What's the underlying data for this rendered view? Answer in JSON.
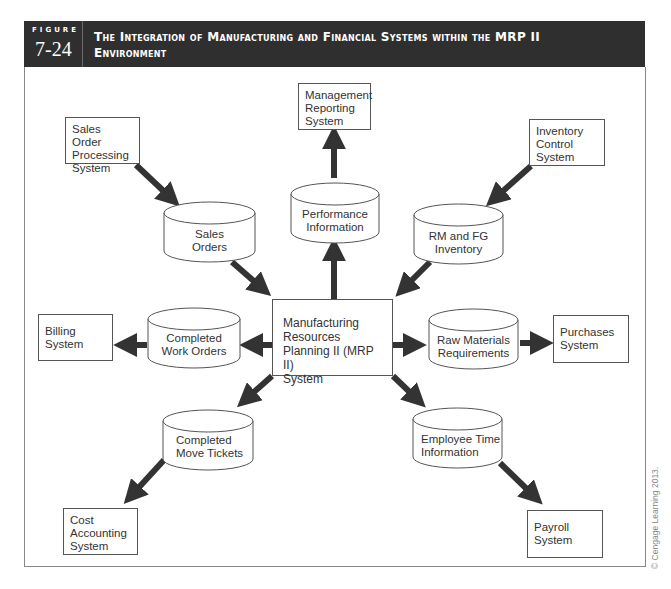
{
  "figure": {
    "label": "FIGURE",
    "number": "7-24",
    "title_line1": "The Integration of Manufacturing and Financial Systems within the MRP II",
    "title_line2": "Environment"
  },
  "center": {
    "line1": "Manufacturing",
    "line2": "Resources",
    "line3": "Planning II (MRP II)",
    "line4": "System"
  },
  "systems": {
    "sales_order": [
      "Sales Order",
      "Processing",
      "System"
    ],
    "management_reporting": [
      "Management",
      "Reporting",
      "System"
    ],
    "inventory_control": [
      "Inventory",
      "Control",
      "System"
    ],
    "billing": [
      "Billing",
      "System"
    ],
    "purchases": [
      "Purchases",
      "System"
    ],
    "cost_accounting": [
      "Cost",
      "Accounting",
      "System"
    ],
    "payroll": [
      "Payroll",
      "System"
    ]
  },
  "data_stores": {
    "sales_orders": [
      "Sales",
      "Orders"
    ],
    "performance_information": [
      "Performance",
      "Information"
    ],
    "rm_fg_inventory": [
      "RM and FG",
      "Inventory"
    ],
    "completed_work_orders": [
      "Completed",
      "Work Orders"
    ],
    "raw_materials_requirements": [
      "Raw Materials",
      "Requirements"
    ],
    "completed_move_tickets": [
      "Completed",
      "Move Tickets"
    ],
    "employee_time_information": [
      "Employee Time",
      "Information"
    ]
  },
  "copyright": "© Cengage Learning 2013.",
  "colors": {
    "header_bg": "#2f2f2f",
    "arrow": "#333333",
    "border": "#555555"
  }
}
